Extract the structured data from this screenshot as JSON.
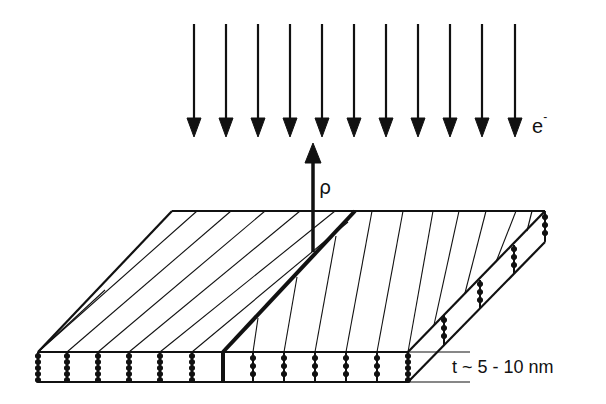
{
  "diagram": {
    "type": "schematic",
    "labels": {
      "electron": "e",
      "electron_charge": "-",
      "rho": "ρ",
      "thickness": "t ~ 5 - 10 nm"
    },
    "incident_arrows": {
      "count": 11,
      "direction": "down"
    },
    "outgoing_arrow": {
      "direction": "up",
      "label": "ρ"
    },
    "colors": {
      "stroke": "#111111",
      "background": "#ffffff"
    }
  }
}
